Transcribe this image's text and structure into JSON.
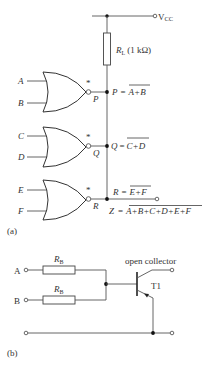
{
  "figure_a": {
    "caption": "(a)",
    "supply": "VCC",
    "supply_main": "V",
    "supply_sub": "CC",
    "load_resistor": {
      "symbol": "R",
      "sub": "L",
      "value": "(1 kΩ)"
    },
    "gates": [
      {
        "inputs": [
          "A",
          "B"
        ],
        "output": "P",
        "marker": "*",
        "expr_lhs": "P",
        "expr_rhs": "A+B"
      },
      {
        "inputs": [
          "C",
          "D"
        ],
        "output": "Q",
        "marker": "*",
        "expr_lhs": "Q",
        "expr_rhs": "C+D"
      },
      {
        "inputs": [
          "E",
          "F"
        ],
        "output": "R",
        "marker": "*",
        "expr_lhs": "R",
        "expr_rhs": "E+F"
      }
    ],
    "output": {
      "lhs": "Z",
      "rhs": "A+B+C+D+E+F"
    },
    "equals": "="
  },
  "figure_b": {
    "caption": "(b)",
    "inputs": [
      "A",
      "B"
    ],
    "resistor": {
      "symbol": "R",
      "sub": "B"
    },
    "transistor_label": "T1",
    "annotation": "open collector"
  }
}
